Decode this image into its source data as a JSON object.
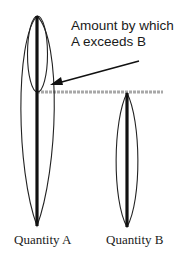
{
  "annotation": {
    "line1": "Amount by which",
    "line2": "A exceeds B"
  },
  "labels": {
    "quantity_a": "Quantity A",
    "quantity_b": "Quantity B"
  },
  "colors": {
    "bar": "#111111",
    "outline": "#222222",
    "reference_line": "#a8a8a8",
    "background": "#ffffff"
  },
  "quantities": [
    {
      "name": "Quantity A",
      "relative_height": 1.0
    },
    {
      "name": "Quantity B",
      "relative_height": 0.64
    }
  ]
}
